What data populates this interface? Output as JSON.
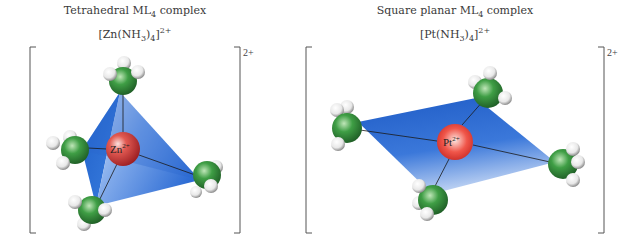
{
  "panels": [
    {
      "id": "tetrahedral",
      "title_prefix": "Tetrahedral ML",
      "title_sub": "4",
      "title_suffix": " complex",
      "formula_open": "[Zn(NH",
      "formula_sub1": "3",
      "formula_mid": ")",
      "formula_sub2": "4",
      "formula_close": "]",
      "formula_charge": "2+",
      "bracket_charge": "2+",
      "metal_symbol": "Zn",
      "metal_charge": "2+",
      "ligand_count": 4,
      "geometry": "tetrahedral"
    },
    {
      "id": "square-planar",
      "title_prefix": "Square planar ML",
      "title_sub": "4",
      "title_suffix": " complex",
      "formula_open": "[Pt(NH",
      "formula_sub1": "3",
      "formula_mid": ")",
      "formula_sub2": "4",
      "formula_close": "]",
      "formula_charge": "2+",
      "bracket_charge": "2+",
      "metal_symbol": "Pt",
      "metal_charge": "2+",
      "ligand_count": 4,
      "geometry": "square planar"
    }
  ],
  "colors": {
    "polyhedron": "#2f6fd6",
    "metal": "#d83a3a",
    "nitrogen": "#2f8a3a",
    "hydrogen": "#f2f2f2",
    "bond": "#1a1a1a"
  }
}
